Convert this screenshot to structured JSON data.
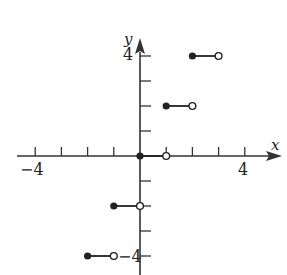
{
  "chart_data": {
    "type": "step",
    "title": "",
    "xlabel": "x",
    "ylabel": "y",
    "xlim": [
      -5,
      5
    ],
    "ylim": [
      -4.5,
      5
    ],
    "x_tick_labels": [
      {
        "value": -4,
        "label": "-4"
      },
      {
        "value": 4,
        "label": "4"
      }
    ],
    "y_tick_labels": [
      {
        "value": 4,
        "label": "4"
      },
      {
        "value": -4,
        "label": "-4"
      }
    ],
    "x_ticks": [
      -4,
      -3,
      -2,
      -1,
      0,
      1,
      2,
      3,
      4
    ],
    "y_ticks": [
      -4,
      -3,
      -2,
      -1,
      1,
      2,
      3,
      4
    ],
    "grid": false,
    "segments": [
      {
        "x_start": -2,
        "x_end": -1,
        "y": -4,
        "closed_start": true,
        "open_end": true
      },
      {
        "x_start": -1,
        "x_end": 0,
        "y": -2,
        "closed_start": true,
        "open_end": true
      },
      {
        "x_start": 0,
        "x_end": 1,
        "y": 0,
        "closed_start": true,
        "open_end": true
      },
      {
        "x_start": 1,
        "x_end": 2,
        "y": 2,
        "closed_start": true,
        "open_end": true
      },
      {
        "x_start": 2,
        "x_end": 3,
        "y": 4,
        "closed_start": true,
        "open_end": true
      }
    ]
  },
  "labels": {
    "x_axis": "x",
    "y_axis": "y",
    "x_neg4": "−4",
    "x_pos4": "4",
    "y_pos4": "4",
    "y_neg4": "−4"
  }
}
